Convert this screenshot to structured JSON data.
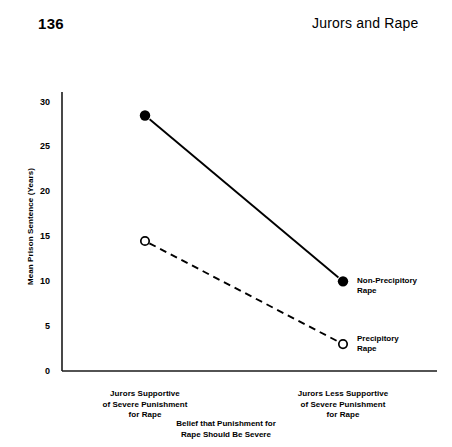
{
  "page": {
    "number": "136",
    "running_head": "Jurors and Rape"
  },
  "chart_data": {
    "type": "line",
    "title": "",
    "xlabel": "Belief that Punishment for Rape Should Be Severe",
    "ylabel": "Mean Prison Sentence (Years)",
    "categories": [
      "Jurors Supportive of Severe Punishment for Rape",
      "Jurors Less Supportive of Severe Punishment for Rape"
    ],
    "category_lines": [
      [
        "Jurors Supportive",
        "of Severe Punishment",
        "for Rape"
      ],
      [
        "Jurors Less Supportive",
        "of Severe Punishment",
        "for Rape"
      ]
    ],
    "xlabel_lines": [
      "Belief that Punishment for",
      "Rape Should Be Severe"
    ],
    "ylim": [
      0,
      30
    ],
    "yticks": [
      0,
      5,
      10,
      15,
      20,
      25,
      30
    ],
    "ytick_labels": [
      "0",
      "5",
      "10",
      "15",
      "20",
      "25",
      "30"
    ],
    "grid": false,
    "legend_position": "inline-right",
    "series": [
      {
        "name": "Non-Precipitory Rape",
        "name_lines": [
          "Non-Precipitory",
          "Rape"
        ],
        "marker": "filled-circle",
        "linestyle": "solid",
        "color": "#000000",
        "values": [
          28.5,
          10
        ]
      },
      {
        "name": "Precipitory Rape",
        "name_lines": [
          "Precipitory",
          "Rape"
        ],
        "marker": "open-circle",
        "linestyle": "dashed",
        "color": "#000000",
        "values": [
          14.5,
          3
        ]
      }
    ]
  }
}
